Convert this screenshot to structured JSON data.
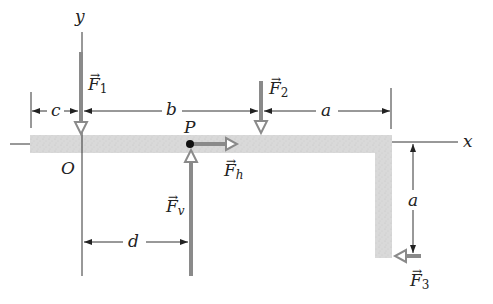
{
  "diagram": {
    "title": "",
    "axes": {
      "x_label": "x",
      "y_label": "y",
      "origin_label": "O"
    },
    "point": {
      "label": "P"
    },
    "forces": [
      {
        "id": "F1",
        "symbol": "F",
        "subscript": "1",
        "direction": "down"
      },
      {
        "id": "F2",
        "symbol": "F",
        "subscript": "2",
        "direction": "down"
      },
      {
        "id": "Fh",
        "symbol": "F",
        "subscript": "h",
        "direction": "right"
      },
      {
        "id": "Fv",
        "symbol": "F",
        "subscript": "v",
        "direction": "up"
      },
      {
        "id": "F3",
        "symbol": "F",
        "subscript": "3",
        "direction": "left"
      }
    ],
    "dimensions": {
      "c": "c",
      "b": "b",
      "a_top": "a",
      "a_right": "a",
      "d": "d"
    },
    "vector_arrow": "→",
    "colors": {
      "beam": "#d6d6d6",
      "arrow": "#8a8a8a",
      "line": "#333333",
      "point": "#111111"
    }
  }
}
